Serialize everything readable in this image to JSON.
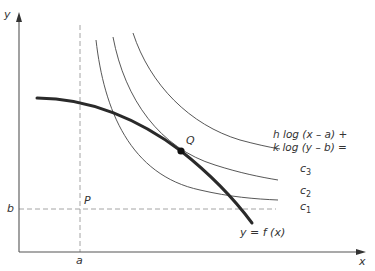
{
  "diagram": {
    "axes": {
      "x_label": "x",
      "y_label": "y"
    },
    "point_P": {
      "label": "P",
      "x_tick": "a",
      "y_tick": "b"
    },
    "point_Q": {
      "label": "Q"
    },
    "constraint_curve": {
      "label": "y = f (x)"
    },
    "level_curves": {
      "equation_line1": "h log (x – a) +",
      "equation_line2": "k log (y – b) =",
      "labels": [
        {
          "name": "c",
          "sub": "3"
        },
        {
          "name": "c",
          "sub": "2"
        },
        {
          "name": "c",
          "sub": "1"
        }
      ]
    },
    "colors": {
      "axis": "#555555",
      "thick_curve": "#2a2a2a",
      "thin_curve": "#444444",
      "dashed": "#999999",
      "point": "#111111"
    }
  }
}
